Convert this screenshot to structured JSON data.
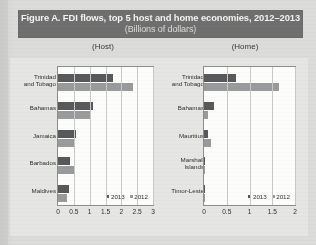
{
  "banner": {
    "title": "Figure A. FDI flows, top 5 host and home economies, 2012–2013",
    "subtitle": "(Billions of dollars)",
    "background_color": "#6e6f6e",
    "text_color": "#f4f4f2"
  },
  "panels": {
    "host_caption": "(Host)",
    "home_caption": "(Home)"
  },
  "legend": {
    "series_2013": "2013",
    "series_2012": "2012",
    "color_2013": "#58595b",
    "color_2012": "#9a9b9c"
  },
  "chart_data": [
    {
      "type": "bar",
      "title": "(Host)",
      "orientation": "horizontal",
      "categories": [
        "Trinidad and Tobago",
        "Bahamas",
        "Jamaica",
        "Barbados",
        "Maldives"
      ],
      "series": [
        {
          "name": "2013",
          "values": [
            1.73,
            1.1,
            0.57,
            0.38,
            0.36
          ]
        },
        {
          "name": "2012",
          "values": [
            2.37,
            1.05,
            0.5,
            0.49,
            0.29
          ]
        }
      ],
      "xlabel": "",
      "ylabel": "",
      "xlim": [
        0,
        3
      ],
      "xticks": [
        0,
        0.5,
        1,
        1.5,
        2,
        2.5,
        3
      ],
      "xtick_labels": [
        "0",
        "0.5",
        "1",
        "1.5",
        "2",
        "2.5",
        "3"
      ],
      "grid": true,
      "legend_position": "inside bottom-right"
    },
    {
      "type": "bar",
      "title": "(Home)",
      "orientation": "horizontal",
      "categories": [
        "Trinidad and Tobago",
        "Bahamas",
        "Mauritius",
        "Marshall Islands",
        "Timor-Leste"
      ],
      "series": [
        {
          "name": "2013",
          "values": [
            0.7,
            0.22,
            0.08,
            0.03,
            0.02
          ]
        },
        {
          "name": "2012",
          "values": [
            1.65,
            0.08,
            0.16,
            0.03,
            0.01
          ]
        }
      ],
      "xlabel": "",
      "ylabel": "",
      "xlim": [
        0,
        2
      ],
      "xticks": [
        0,
        0.5,
        1,
        1.5,
        2
      ],
      "xtick_labels": [
        "0",
        "0.5",
        "1",
        "1.5",
        "2"
      ],
      "grid": true,
      "legend_position": "inside bottom-right"
    }
  ]
}
